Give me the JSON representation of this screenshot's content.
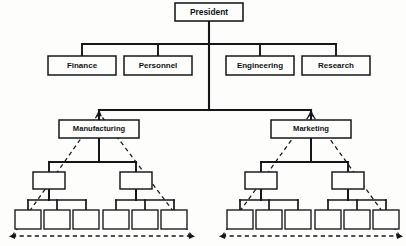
{
  "diagram": {
    "type": "organization-chart",
    "background_color": "#fdfdfb",
    "line_color": "#15161a",
    "box_fill": "#fdfdfb",
    "canvas": {
      "width": 406,
      "height": 246
    }
  },
  "nodes": {
    "president": {
      "label": "President",
      "level": 0,
      "x": 175,
      "y": 3,
      "w": 68,
      "h": 18,
      "font_size": 8.4
    },
    "staff": [
      {
        "label": "Finance",
        "x": 48,
        "y": 56,
        "w": 68,
        "h": 19,
        "font_size": 8.0
      },
      {
        "label": "Personnel",
        "x": 124,
        "y": 56,
        "w": 68,
        "h": 19,
        "font_size": 8.0
      },
      {
        "label": "Engineering",
        "x": 226,
        "y": 56,
        "w": 68,
        "h": 19,
        "font_size": 8.0
      },
      {
        "label": "Research",
        "x": 302,
        "y": 56,
        "w": 68,
        "h": 19,
        "font_size": 8.0
      }
    ],
    "divisions": [
      {
        "label": "Manufacturing",
        "x": 59,
        "y": 120,
        "w": 80,
        "h": 18,
        "font_size": 7.6
      },
      {
        "label": "Marketing",
        "x": 271,
        "y": 120,
        "w": 80,
        "h": 18,
        "font_size": 7.6
      }
    ],
    "midlevel": [
      {
        "label": "",
        "x": 33,
        "y": 172,
        "w": 32,
        "h": 17
      },
      {
        "label": "",
        "x": 120,
        "y": 172,
        "w": 32,
        "h": 17
      },
      {
        "label": "",
        "x": 245,
        "y": 172,
        "w": 32,
        "h": 17
      },
      {
        "label": "",
        "x": 332,
        "y": 172,
        "w": 32,
        "h": 17
      }
    ],
    "leaves": [
      {
        "label": "",
        "x": 15,
        "y": 210,
        "w": 26,
        "h": 19
      },
      {
        "label": "",
        "x": 44,
        "y": 210,
        "w": 26,
        "h": 19
      },
      {
        "label": "",
        "x": 73,
        "y": 210,
        "w": 26,
        "h": 19
      },
      {
        "label": "",
        "x": 103,
        "y": 210,
        "w": 26,
        "h": 19
      },
      {
        "label": "",
        "x": 132,
        "y": 210,
        "w": 26,
        "h": 19
      },
      {
        "label": "",
        "x": 161,
        "y": 210,
        "w": 26,
        "h": 19
      },
      {
        "label": "",
        "x": 227,
        "y": 210,
        "w": 26,
        "h": 19
      },
      {
        "label": "",
        "x": 256,
        "y": 210,
        "w": 26,
        "h": 19
      },
      {
        "label": "",
        "x": 285,
        "y": 210,
        "w": 26,
        "h": 19
      },
      {
        "label": "",
        "x": 315,
        "y": 210,
        "w": 26,
        "h": 19
      },
      {
        "label": "",
        "x": 344,
        "y": 210,
        "w": 26,
        "h": 19
      },
      {
        "label": "",
        "x": 373,
        "y": 210,
        "w": 26,
        "h": 19
      }
    ]
  },
  "connectors": {
    "president_stem": "M209,21 L209,110",
    "staff_bar": "M82,44 L336,44",
    "staff_drops": [
      "M82,44 L82,56",
      "M158,44 L158,56",
      "M260,44 L260,56",
      "M336,44 L336,56"
    ],
    "division_bar": "M99,110 L311,110",
    "division_drops": [
      "M99,110 L99,120",
      "M311,110 L311,120"
    ],
    "mid_bars": [
      "M49,162 L136,162",
      "M261,162 L348,162"
    ],
    "mid_stems": [
      "M99,138 L99,162",
      "M311,138 L311,162"
    ],
    "mid_drops": [
      "M49,162 L49,172",
      "M136,162 L136,172",
      "M261,162 L261,172",
      "M348,162 L348,172"
    ],
    "leaf_bars": [
      "M28,200 L86,200",
      "M116,200 L174,200",
      "M240,200 L298,200",
      "M328,200 L386,200"
    ],
    "leaf_stems": [
      "M49,189 L49,200",
      "M136,189 L136,200",
      "M261,189 L261,200",
      "M348,189 L348,200"
    ],
    "leaf_drops": [
      "M28,200 L28,210",
      "M57,200 L57,210",
      "M86,200 L86,210",
      "M116,200 L116,210",
      "M145,200 L145,210",
      "M174,200 L174,210",
      "M240,200 L240,210",
      "M269,200 L269,210",
      "M298,200 L298,210",
      "M328,200 L328,210",
      "M357,200 L357,210",
      "M386,200 L386,210"
    ]
  },
  "dashed_triangles": [
    {
      "name": "manufacturing-scope-triangle",
      "apex_x": 99,
      "apex_y": 113,
      "base_left_x": 12,
      "base_right_x": 192,
      "base_y": 236
    },
    {
      "name": "marketing-scope-triangle",
      "apex_x": 311,
      "apex_y": 113,
      "base_left_x": 222,
      "base_right_x": 400,
      "base_y": 236
    }
  ]
}
